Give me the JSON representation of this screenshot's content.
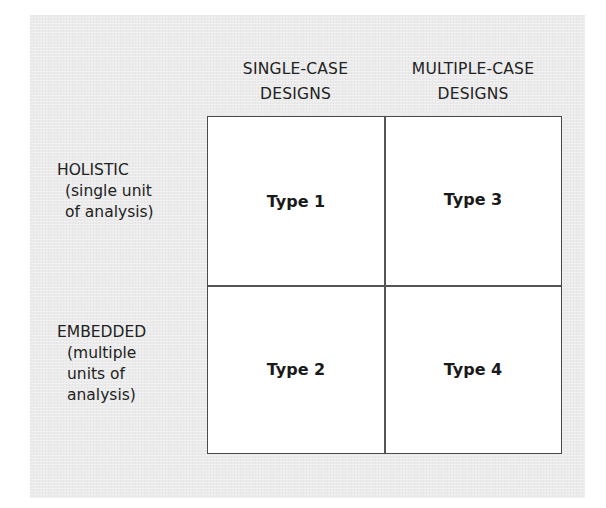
{
  "diagram": {
    "type": "2x2 matrix",
    "columns": [
      {
        "line1": "SINGLE-CASE",
        "line2": "DESIGNS"
      },
      {
        "line1": "MULTIPLE-CASE",
        "line2": "DESIGNS"
      }
    ],
    "rows": [
      {
        "label": "HOLISTIC",
        "sub_lines": [
          "(single unit",
          "of analysis)"
        ]
      },
      {
        "label": "EMBEDDED",
        "sub_lines": [
          "(multiple",
          "units of",
          "analysis)"
        ]
      }
    ],
    "cells": {
      "holistic_single": "Type 1",
      "holistic_multiple": "Type 3",
      "embedded_single": "Type 2",
      "embedded_multiple": "Type 4"
    },
    "colors": {
      "panel_background": "#ebebeb",
      "grid_background": "#ffffff",
      "line": "#4a4a4a",
      "text": "#222222"
    }
  }
}
